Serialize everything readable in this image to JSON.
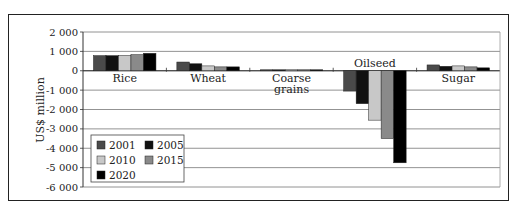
{
  "chart_data": {
    "type": "bar",
    "title": "",
    "xlabel": "",
    "ylabel": "US$ million",
    "ylim": [
      -6000,
      2000
    ],
    "yticks": [
      2000,
      1000,
      0,
      -1000,
      -2000,
      -3000,
      -4000,
      -5000,
      -6000
    ],
    "ytick_labels": [
      "2 000",
      "1 000",
      "0",
      "-1 000",
      "-2 000",
      "-3 000",
      "-4 000",
      "-5 000",
      "-6 000"
    ],
    "grid": true,
    "legend_position": "lower-left inside",
    "categories": [
      "Rice",
      "Wheat",
      "Coarse grains",
      "Oilseed",
      "Sugar"
    ],
    "category_labels": [
      [
        "Rice"
      ],
      [
        "Wheat"
      ],
      [
        "Coarse",
        "grains"
      ],
      [
        "Oilseed"
      ],
      [
        "Sugar"
      ]
    ],
    "series": [
      {
        "name": "2001",
        "color": "#4a4a4a",
        "values": [
          780,
          450,
          50,
          -1050,
          300
        ]
      },
      {
        "name": "2005",
        "color": "#111111",
        "values": [
          780,
          360,
          50,
          -1700,
          230
        ]
      },
      {
        "name": "2010",
        "color": "#c8c8c8",
        "values": [
          790,
          250,
          50,
          -2550,
          250
        ]
      },
      {
        "name": "2015",
        "color": "#8a8a8a",
        "values": [
          830,
          200,
          50,
          -3500,
          200
        ]
      },
      {
        "name": "2020",
        "color": "#000000",
        "values": [
          900,
          200,
          50,
          -4750,
          150
        ]
      }
    ]
  }
}
